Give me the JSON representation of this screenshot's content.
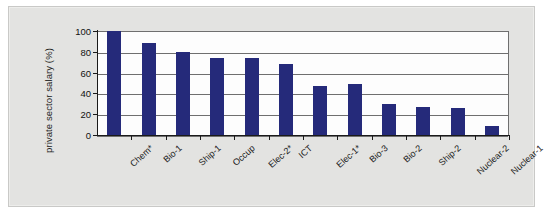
{
  "chart_data": {
    "type": "bar",
    "title": "",
    "subtitle": "",
    "xlabel": "",
    "ylabel": "private sector salary (%)",
    "ylim": [
      0,
      100
    ],
    "yticks": [
      0,
      20,
      40,
      60,
      80,
      100
    ],
    "grid": true,
    "legend": null,
    "bar_color": "#252a7a",
    "categories": [
      "Chem*",
      "Bio-1",
      "Ship-1",
      "Occup",
      "Elec-2*",
      "ICT",
      "Elec-1*",
      "Bio-3",
      "Bio-2",
      "Ship-2",
      "Nuclear-2",
      "Nuclear-1"
    ],
    "values": [
      100,
      88,
      80,
      74,
      74,
      68,
      47,
      49,
      30,
      27,
      26,
      9
    ],
    "annotations": []
  },
  "figure": {
    "background_color": "#e3e3e1",
    "plot_background_color": "#fdfdfd",
    "axis_color": "#1a1a1a",
    "gridline_color": "#6f6f6f"
  }
}
